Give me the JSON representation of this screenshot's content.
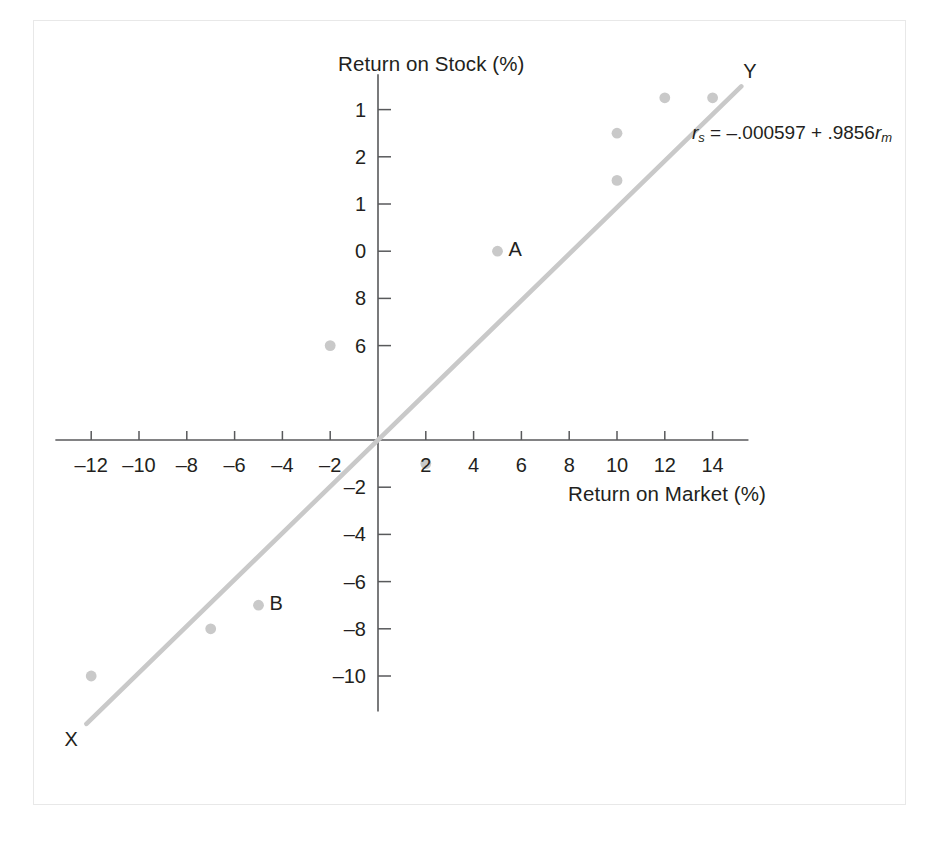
{
  "chart_data": {
    "type": "scatter",
    "title": "",
    "xlabel": "Return on Market (%)",
    "ylabel": "Return on Stock (%)",
    "xlim": [
      -13.5,
      15.5
    ],
    "ylim": [
      -11.5,
      15.5
    ],
    "grid": false,
    "legend": "none",
    "x_ticks": [
      -12,
      -10,
      -8,
      -6,
      -4,
      -2,
      2,
      4,
      6,
      8,
      10,
      12,
      14
    ],
    "x_tick_labels": [
      "–12",
      "–10",
      "–8",
      "–6",
      "–4",
      "–2",
      "2",
      "4",
      "6",
      "8",
      "10",
      "12",
      "14"
    ],
    "y_ticks": [
      14,
      12,
      10,
      8,
      6,
      -2,
      -4,
      -6,
      -8,
      -10
    ],
    "y_tick_labels": [
      "1",
      "2",
      "1",
      "0",
      "8",
      "6",
      "–2",
      "–4",
      "–6",
      "–8",
      "–10"
    ],
    "y_tick_values_rendered": [
      {
        "value": 14,
        "label": "1"
      },
      {
        "value": 12,
        "label": "2"
      },
      {
        "value": 10,
        "label": "1"
      },
      {
        "value": 8,
        "label": "0"
      },
      {
        "value": 6,
        "label": "8"
      },
      {
        "value": 4,
        "label": "6"
      },
      {
        "value": -2,
        "label": "–2"
      },
      {
        "value": -4,
        "label": "–4"
      },
      {
        "value": -6,
        "label": "–6"
      },
      {
        "value": -8,
        "label": "–8"
      },
      {
        "value": -10,
        "label": "–10"
      }
    ],
    "points": [
      {
        "x": -12,
        "y": -10,
        "label": ""
      },
      {
        "x": -7,
        "y": -8,
        "label": ""
      },
      {
        "x": -5,
        "y": -7,
        "label": "B"
      },
      {
        "x": -2,
        "y": 4,
        "label": ""
      },
      {
        "x": 2,
        "y": -1,
        "label": ""
      },
      {
        "x": 5,
        "y": 8,
        "label": "A"
      },
      {
        "x": 10,
        "y": 11,
        "label": ""
      },
      {
        "x": 10,
        "y": 13,
        "label": ""
      },
      {
        "x": 12,
        "y": 14.5,
        "label": ""
      },
      {
        "x": 14,
        "y": 14.5,
        "label": ""
      }
    ],
    "fit_line": {
      "intercept": -0.000597,
      "slope": 0.9856,
      "x_start": -12.2,
      "x_end": 15.2,
      "start_label": "X",
      "end_label": "Y"
    },
    "annotations": [
      {
        "name": "regression-equation",
        "parts": {
          "lhs_var": "r",
          "lhs_sub": "s",
          "equals": " = ",
          "intercept": "–.000597",
          "plus": " + ",
          "slope": ".9856",
          "rhs_var": "r",
          "rhs_sub": "m"
        },
        "text": "rₛ = –.000597 + .9856rₘ"
      }
    ]
  },
  "colors": {
    "point": "#c9c9c9",
    "line": "#c9c9c9",
    "axis": "#58595b",
    "text": "#231f20",
    "frame": "#e8e8e8",
    "background": "#ffffff"
  },
  "axis_titles": {
    "y": "Return on Stock (%)",
    "x": "Return on Market (%)"
  },
  "point_labels": {
    "a": "A",
    "b": "B",
    "x": "X",
    "y": "Y"
  }
}
